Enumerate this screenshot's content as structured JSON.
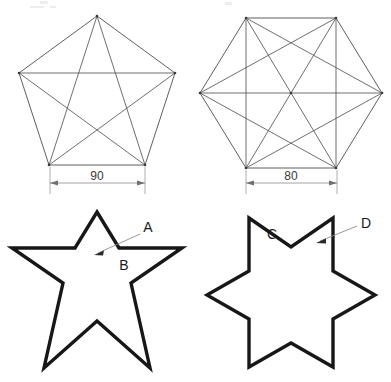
{
  "drawing": {
    "title": "Polygon construction and star profile drawing",
    "background_color": "#ffffff",
    "line_color": "#4d4d4d",
    "star_color": "#171717",
    "dimension_color": "#8a8a8a",
    "width": 391,
    "height": 382
  },
  "figures": {
    "top_left": {
      "name": "pentagon-with-diagonals",
      "shape": "pentagon",
      "sides": 5,
      "center_x": 97,
      "center_y": 98,
      "circumradius": 82,
      "rotation_deg": -90,
      "diagonals": "all",
      "vertex_count": 5,
      "edge_count": 5,
      "diagonal_count": 5,
      "dimension": {
        "label": "90",
        "value": 90,
        "y": 183,
        "x_start": 50,
        "x_end": 145
      }
    },
    "top_right": {
      "name": "hexagon-with-diagonals",
      "shape": "hexagon",
      "sides": 6,
      "center_x": 291,
      "center_y": 93,
      "circumradius": 91,
      "rotation_deg": 0,
      "diagonals": "all",
      "vertex_count": 6,
      "edge_count": 6,
      "diagonal_count": 9,
      "dimension": {
        "label": "80",
        "value": 80,
        "y": 183,
        "x_start": 245,
        "x_end": 337
      }
    },
    "bottom_left": {
      "name": "five-point-star",
      "shape": "star",
      "points": 5,
      "center_x": 97,
      "center_y": 300,
      "outer_radius": 88,
      "inner_radius": 37,
      "rotation_deg": -90,
      "callouts": [
        {
          "label": "A",
          "text_x": 148,
          "text_y": 231,
          "leader_from_x": 140,
          "leader_from_y": 234,
          "leader_to_x": 96,
          "leader_to_y": 253,
          "target": "outer-edge-of-top-point"
        },
        {
          "label": "B",
          "text_x": 124,
          "text_y": 269,
          "leader_from_x": null,
          "leader_from_y": null,
          "leader_to_x": null,
          "leader_to_y": null,
          "target": "inner-vertex-right-of-top-point"
        }
      ]
    },
    "bottom_right": {
      "name": "six-point-star",
      "shape": "star",
      "points": 6,
      "center_x": 291,
      "center_y": 295,
      "outer_radius": 84,
      "inner_radius": 48,
      "rotation_deg": -90,
      "callouts": [
        {
          "label": "C",
          "text_x": 272,
          "text_y": 237,
          "leader_from_x": null,
          "leader_from_y": null,
          "leader_to_x": null,
          "leader_to_y": null,
          "target": "inner-notch-top"
        },
        {
          "label": "D",
          "text_x": 366,
          "text_y": 227,
          "leader_from_x": 357,
          "leader_from_y": 230,
          "leader_to_x": 318,
          "leader_to_y": 243,
          "target": "edge-of-upper-right-point"
        }
      ]
    }
  },
  "labels": {
    "dim_left": "90",
    "dim_right": "80",
    "callout_a": "A",
    "callout_b": "B",
    "callout_c": "C",
    "callout_d": "D"
  }
}
